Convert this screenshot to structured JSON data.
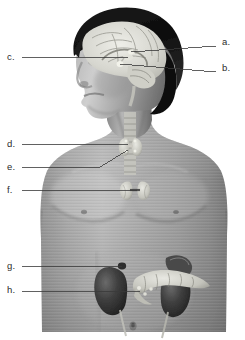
{
  "figure": {
    "background_color": "#ffffff",
    "width": 245,
    "height": 340,
    "style": "grayscale anatomical photograph illustration"
  },
  "labels": [
    {
      "id": "a",
      "text": "a.",
      "x": 222,
      "y": 42,
      "side": "right"
    },
    {
      "id": "b",
      "text": "b.",
      "x": 222,
      "y": 68,
      "side": "right"
    },
    {
      "id": "c",
      "text": "c.",
      "x": 7,
      "y": 57,
      "side": "left"
    },
    {
      "id": "d",
      "text": "d.",
      "x": 7,
      "y": 141,
      "side": "left"
    },
    {
      "id": "e",
      "text": "e.",
      "x": 7,
      "y": 164,
      "side": "left"
    },
    {
      "id": "f",
      "text": "f.",
      "x": 7,
      "y": 186,
      "side": "left"
    },
    {
      "id": "g",
      "text": "g.",
      "x": 7,
      "y": 264,
      "side": "left"
    },
    {
      "id": "h",
      "text": "h.",
      "x": 7,
      "y": 288,
      "side": "left"
    }
  ],
  "leader_lines": [
    {
      "id": "a",
      "points": "216,46 131,52",
      "target": "pineal-gland"
    },
    {
      "id": "b",
      "points": "216,72 120,64",
      "target": "pituitary-gland"
    },
    {
      "id": "c",
      "points": "22,57 128,57",
      "target": "hypothalamus"
    },
    {
      "id": "d",
      "points": "22,144 128,144",
      "target": "thyroid-gland"
    },
    {
      "id": "e",
      "points": "22,167 100,167 128,150",
      "target": "parathyroid-glands"
    },
    {
      "id": "f",
      "points": "22,190 137,190",
      "target": "thymus"
    },
    {
      "id": "g",
      "points": "22,267 122,266",
      "target": "adrenal-gland"
    },
    {
      "id": "h",
      "points": "22,291 140,292",
      "target": "pancreas"
    }
  ],
  "line_style": {
    "color": "#3a3a3a",
    "width": 0.8
  },
  "anatomy": {
    "body_tone_light": "#b9b9b9",
    "body_tone_mid": "#8f8f8f",
    "body_tone_dark": "#5d5d5d",
    "hair_color": "#141414",
    "brain_color": "#dcdcd6",
    "gland_color": "#cfcfc9",
    "organ_dark": "#3c3c3c",
    "parts": [
      "hair",
      "face",
      "brain-sagittal-section",
      "pineal-gland",
      "pituitary-gland",
      "hypothalamus",
      "trachea",
      "thyroid-gland",
      "parathyroid-glands",
      "thymus",
      "left-kidney",
      "right-kidney",
      "adrenal-glands",
      "pancreas",
      "ureters",
      "navel"
    ]
  }
}
